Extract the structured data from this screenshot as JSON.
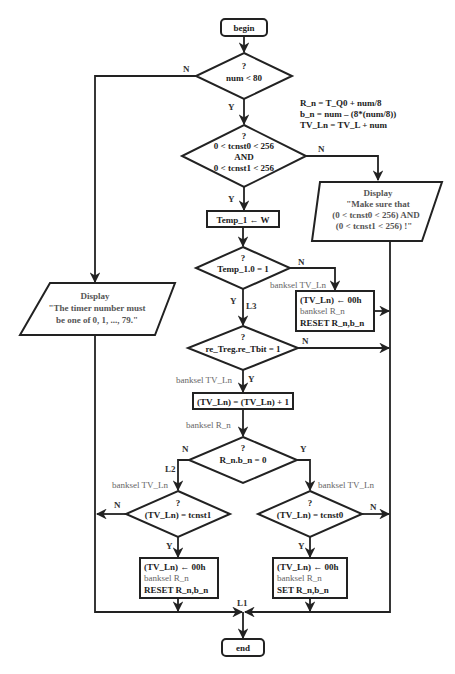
{
  "terminals": {
    "begin": "begin",
    "end": "end"
  },
  "formulas": {
    "line1": "R_n = T_Q0 + num/8",
    "line2": "b_n =  num – (8*(num/8))",
    "line3": "TV_Ln =  TV_L + num"
  },
  "decisions": {
    "num_check": {
      "q": "?",
      "cond": "num  <  80"
    },
    "tcnst_check": {
      "q": "?",
      "line1": "0 <  tcnst0 < 256",
      "line2": "AND",
      "line3": "0 <  tcnst1 < 256"
    },
    "temp_check": {
      "q": "?",
      "cond": "Temp_1.0 = 1"
    },
    "treg_check": {
      "q": "?",
      "cond": "re_Treg.re_Tbit = 1"
    },
    "rnbn_check": {
      "q": "?",
      "cond": "R_n.b_n = 0"
    },
    "tcnst1_check": {
      "q": "?",
      "cond": "(TV_Ln)  = tcnst1"
    },
    "tcnst0_check": {
      "q": "?",
      "cond": "(TV_Ln)  = tcnst0"
    }
  },
  "processes": {
    "temp_assign": "Temp_1 ← W",
    "increment": "(TV_Ln) = (TV_Ln) + 1",
    "reset_box_top": {
      "l1": "(TV_Ln) ← 00h",
      "l2": "banksel R_n",
      "l3": "RESET  R_n,b_n"
    },
    "reset_box_left": {
      "l1": "(TV_Ln) ← 00h",
      "l2": "banksel R_n",
      "l3": "RESET  R_n,b_n"
    },
    "set_box_right": {
      "l1": "(TV_Ln) ← 00h",
      "l2": "banksel R_n",
      "l3": "SET  R_n,b_n"
    }
  },
  "displays": {
    "timer_error": {
      "l1": "Display",
      "l2": "\"The timer number must",
      "l3": "be one of 0, 1, ..., 79.\""
    },
    "tcnst_error": {
      "l1": "Display",
      "l2": "\"Make sure that",
      "l3": "(0 < tcnst0 < 256) AND",
      "l4": "(0 < tcnst1 < 256) !\""
    }
  },
  "annotations": {
    "banksel_tvln_1": "banksel TV_Ln",
    "banksel_tvln_2": "banksel TV_Ln",
    "banksel_rn": "banksel R_n",
    "banksel_tvln_3": "banksel TV_Ln",
    "banksel_tvln_4": "banksel TV_Ln",
    "label_L1": "L1",
    "label_L2": "L2",
    "label_L3": "L3"
  },
  "branch_labels": {
    "yes": "Y",
    "no": "N"
  }
}
